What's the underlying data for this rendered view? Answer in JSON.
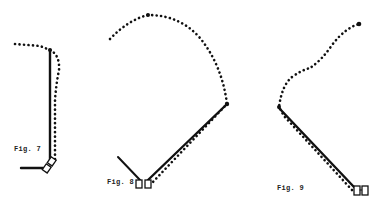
{
  "figures": [
    {
      "id": "fig7",
      "label": "Fig. 7",
      "label_pos": {
        "x": 14,
        "y": 145
      },
      "description": "Vertical solid link from base up to top joint; dotted path curls left at top and descends alongside the link",
      "base_bar": {
        "x1": 21,
        "y1": 168,
        "x2": 43,
        "y2": 168
      },
      "solid_link": {
        "x1": 50,
        "y1": 160,
        "x2": 50,
        "y2": 50
      },
      "top_joint": {
        "x": 50,
        "y": 50
      },
      "dotted_path": "M 15 44 L 28 45 L 40 46 L 50 50 Q 60 55 59 70 Q 56 85 55 100 L 55 160",
      "boxes": [
        {
          "x": 44,
          "y": 167,
          "w": 6,
          "h": 7,
          "rotate": 35
        },
        {
          "x": 50,
          "y": 160,
          "w": 6,
          "h": 7,
          "rotate": 35
        }
      ]
    },
    {
      "id": "fig8",
      "label": "Fig. 8",
      "label_pos": {
        "x": 107,
        "y": 181
      },
      "description": "Diagonal solid link from base up-right to elbow joint; thin arm extends up-left from base; dotted arc sweeps from left, over top apex, down to elbow, then back along the link",
      "thin_arm": {
        "x1": 118,
        "y1": 157,
        "x2": 140,
        "y2": 180
      },
      "solid_link": {
        "x1": 148,
        "y1": 180,
        "x2": 226,
        "y2": 105
      },
      "elbow_joint": {
        "x": 227,
        "y": 104
      },
      "apex_joint": {
        "x": 148,
        "y": 15
      },
      "dotted_path": "M 110 39 Q 128 20 148 15 Q 180 15 200 38 Q 222 65 227 104 L 152 183",
      "boxes": [
        {
          "x": 136,
          "y": 180,
          "w": 6,
          "h": 8,
          "rotate": 0
        },
        {
          "x": 145,
          "y": 180,
          "w": 6,
          "h": 8,
          "rotate": 0
        }
      ]
    },
    {
      "id": "fig9",
      "label": "Fig. 9",
      "label_pos": {
        "x": 277,
        "y": 187
      },
      "description": "Diagonal solid link from left elbow joint down-right to base; dotted path rises from elbow in an S-curve to top-right end joint and returns alongside the link",
      "solid_link": {
        "x1": 279,
        "y1": 108,
        "x2": 354,
        "y2": 187
      },
      "elbow_joint": {
        "x": 279,
        "y": 107
      },
      "end_joint": {
        "x": 359,
        "y": 24
      },
      "dotted_path": "M 354 187 L 285 115 L 279 107 Q 282 85 292 77 Q 302 70 310 68 Q 322 60 332 45 Q 345 28 359 24",
      "boxes": [
        {
          "x": 354,
          "y": 186,
          "w": 6,
          "h": 9,
          "rotate": 0
        },
        {
          "x": 362,
          "y": 186,
          "w": 6,
          "h": 9,
          "rotate": 0
        }
      ]
    }
  ],
  "colors": {
    "ink": "#111111",
    "paper": "#ffffff"
  }
}
